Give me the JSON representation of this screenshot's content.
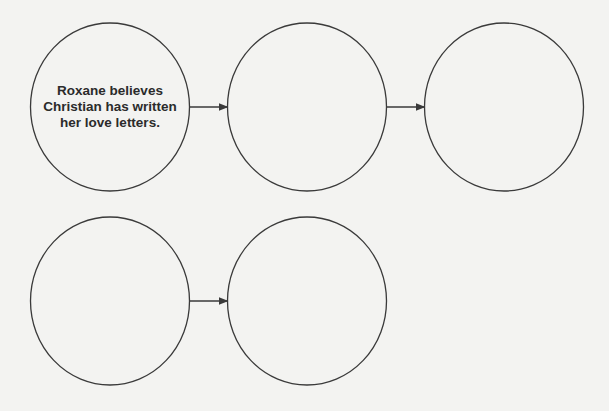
{
  "diagram": {
    "title": "",
    "nodes": [
      {
        "id": "n1",
        "row": 1,
        "col": 1,
        "text": "Roxane believes Christian has written her love letters."
      },
      {
        "id": "n2",
        "row": 1,
        "col": 2,
        "text": ""
      },
      {
        "id": "n3",
        "row": 1,
        "col": 3,
        "text": ""
      },
      {
        "id": "n4",
        "row": 2,
        "col": 1,
        "text": ""
      },
      {
        "id": "n5",
        "row": 2,
        "col": 2,
        "text": ""
      }
    ],
    "edges": [
      {
        "from": "n1",
        "to": "n2"
      },
      {
        "from": "n2",
        "to": "n3"
      },
      {
        "from": "n4",
        "to": "n5"
      }
    ],
    "colors": {
      "stroke": "#3a3a3a",
      "text": "#2b2b2b",
      "background": "#f3f3f1"
    }
  }
}
